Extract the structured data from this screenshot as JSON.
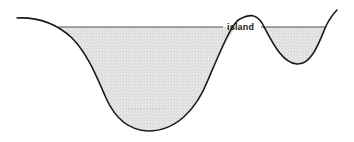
{
  "diagram": {
    "type": "cross-section",
    "labels": {
      "island": "island"
    },
    "colors": {
      "ground_line": "#1a1a1a",
      "water_fill": "#e2e2e2",
      "water_surface": "#555555",
      "background": "#ffffff"
    }
  }
}
